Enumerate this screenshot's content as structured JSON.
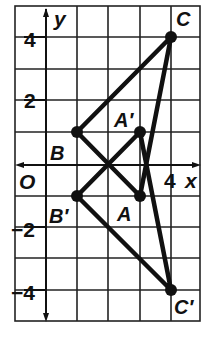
{
  "diagram": {
    "type": "coordinate-plane-reflection",
    "axes": {
      "x_label": "x",
      "y_label": "y",
      "origin_label": "O",
      "x_range": [
        -1,
        5
      ],
      "y_range": [
        -5,
        5
      ],
      "x_tick_labels": [
        {
          "value": 4,
          "text": "4"
        }
      ],
      "y_tick_labels": [
        {
          "value": 4,
          "text": "4"
        },
        {
          "value": 2,
          "text": "2"
        },
        {
          "value": -2,
          "text": "−2"
        },
        {
          "value": -4,
          "text": "−4"
        }
      ]
    },
    "grid": {
      "visible": true,
      "cell_units": 1
    },
    "figures": [
      {
        "name": "triangle ABC",
        "vertices": [
          {
            "label": "A",
            "x": 3,
            "y": -1
          },
          {
            "label": "B",
            "x": 1,
            "y": 1
          },
          {
            "label": "C",
            "x": 4,
            "y": 4
          }
        ]
      },
      {
        "name": "triangle A'B'C'",
        "vertices": [
          {
            "label": "A′",
            "x": 3,
            "y": 1
          },
          {
            "label": "B′",
            "x": 1,
            "y": -1
          },
          {
            "label": "C′",
            "x": 4,
            "y": -4
          }
        ]
      }
    ],
    "colors": {
      "line": "#111111",
      "grid": "#222222",
      "background": "#ffffff"
    }
  }
}
